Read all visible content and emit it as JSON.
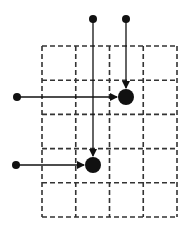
{
  "diagram": {
    "title": "",
    "colors": {
      "ink": "#111111",
      "grid": "#333333",
      "background": "#ffffff"
    },
    "grid": {
      "columns": 4,
      "rows": 5,
      "x0": 42,
      "y0": 46,
      "cell_w": 33.75,
      "cell_h": 34.2,
      "style": "dashed"
    },
    "sources": [
      {
        "id": "top-left-source",
        "x": 93,
        "y": 19,
        "r": 4
      },
      {
        "id": "top-right-source",
        "x": 126,
        "y": 19,
        "r": 4
      },
      {
        "id": "upper-left-source",
        "x": 17,
        "y": 97,
        "r": 4
      },
      {
        "id": "lower-left-source",
        "x": 16,
        "y": 165,
        "r": 4
      }
    ],
    "targets": [
      {
        "id": "upper-target",
        "x": 126,
        "y": 97,
        "r": 8
      },
      {
        "id": "lower-target",
        "x": 93,
        "y": 165,
        "r": 8
      }
    ],
    "arrows": [
      {
        "from": "top-left-source",
        "x1": 93,
        "y1": 19,
        "x2": 93,
        "y2": 156
      },
      {
        "from": "top-right-source",
        "x1": 126,
        "y1": 19,
        "x2": 126,
        "y2": 88
      },
      {
        "from": "upper-left-source",
        "x1": 17,
        "y1": 97,
        "x2": 117,
        "y2": 97
      },
      {
        "from": "lower-left-source",
        "x1": 16,
        "y1": 165,
        "x2": 84,
        "y2": 165
      }
    ]
  }
}
